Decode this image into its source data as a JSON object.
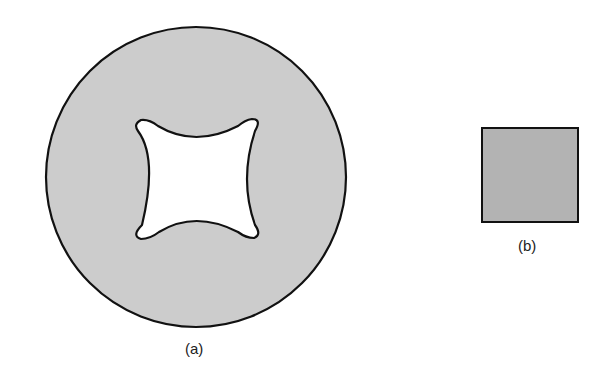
{
  "figure": {
    "panels": [
      {
        "id": "a",
        "label": "(a)",
        "shape": "circular disk with concave square (astroid-like) hole",
        "fill": "#cccccc",
        "stroke": "#111111"
      },
      {
        "id": "b",
        "label": "(b)",
        "shape": "solid square",
        "fill": "#b3b3b3",
        "stroke": "#111111"
      }
    ]
  }
}
